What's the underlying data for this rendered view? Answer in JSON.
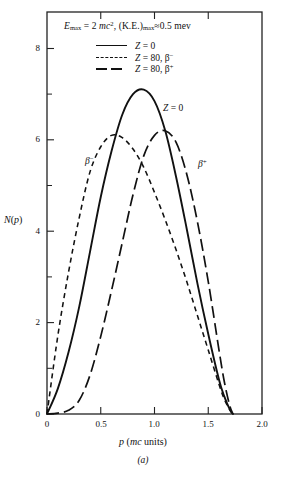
{
  "figure": {
    "caption": "(a)",
    "title_plain": "E_max = 2 mc^2, (K.E.)_max ≈ 0.5 mev",
    "title": {
      "e": "E",
      "e_sub": "max",
      "eq": " = 2 ",
      "mc": "mc",
      "mc_sup": "2",
      "comma": ", (K.E.)",
      "ke_sub": "max",
      "approx": "≈0.5 mev"
    }
  },
  "legend": {
    "position": "top-center-inside",
    "items": [
      {
        "style": "solid",
        "label_plain": "Z = 0",
        "z": "Z",
        "rest": " = 0",
        "sup": ""
      },
      {
        "style": "short-dash",
        "label_plain": "Z = 80, β−",
        "z": "Z",
        "rest": " = 80, β",
        "sup": "−"
      },
      {
        "style": "long-dash",
        "label_plain": "Z = 80, β+",
        "z": "Z",
        "rest": " = 80, β",
        "sup": "+"
      }
    ]
  },
  "axes": {
    "ylabel_n": "N",
    "ylabel_p": "p",
    "ylabel_plain": "N(p)",
    "xlabel_p": "p",
    "xlabel_rest_a": " (",
    "xlabel_mc": "mc",
    "xlabel_rest_b": " units)",
    "xlabel_plain": "p (mc units)",
    "ylim": [
      0,
      8.8
    ],
    "xlim": [
      0,
      2.0
    ],
    "yticks_major": [
      0,
      2,
      4,
      6,
      8
    ],
    "yticks_major_labels": [
      "0",
      "2",
      "4",
      "6",
      "8"
    ],
    "yticks_minor": [
      1,
      3,
      5,
      7
    ],
    "xticks_major": [
      0,
      0.5,
      1.0,
      1.5,
      2.0
    ],
    "xticks_major_labels": [
      "0",
      "0.5",
      "1.0",
      "1.5",
      "2.0"
    ],
    "grid": false,
    "frame": "box"
  },
  "annotations": [
    {
      "id": "z0",
      "text_plain": "Z = 0",
      "z": "Z",
      "rest": " = 0",
      "sup": ""
    },
    {
      "id": "beta-minus",
      "text_plain": "β−",
      "z": "β",
      "rest": "",
      "sup": "−"
    },
    {
      "id": "beta-plus",
      "text_plain": "β+",
      "z": "β",
      "rest": "",
      "sup": "+"
    }
  ],
  "chart_data": {
    "type": "line",
    "xlabel": "p (mc units)",
    "ylabel": "N(p)",
    "xlim": [
      0,
      2.0
    ],
    "ylim": [
      0,
      8.8
    ],
    "grid": false,
    "legend_position": "top-center-inside",
    "x": [
      0.0,
      0.1,
      0.2,
      0.3,
      0.4,
      0.5,
      0.6,
      0.7,
      0.8,
      0.9,
      1.0,
      1.1,
      1.2,
      1.3,
      1.4,
      1.5,
      1.6,
      1.65,
      1.7,
      1.73
    ],
    "series": [
      {
        "name": "Z = 0",
        "style": "solid",
        "peak_x": 0.9,
        "peak_y": 7.1,
        "endpoint_x": 1.73,
        "values": [
          0.0,
          0.55,
          1.35,
          2.35,
          3.55,
          4.75,
          5.75,
          6.55,
          7.0,
          7.1,
          6.85,
          6.2,
          5.2,
          4.05,
          2.85,
          1.75,
          0.75,
          0.38,
          0.1,
          0.0
        ]
      },
      {
        "name": "Z = 80, β−",
        "style": "short-dash",
        "peak_x": 0.62,
        "peak_y": 6.1,
        "endpoint_x": 1.73,
        "values": [
          0.0,
          1.7,
          3.1,
          4.3,
          5.3,
          5.85,
          6.1,
          6.05,
          5.8,
          5.4,
          4.85,
          4.25,
          3.6,
          2.9,
          2.15,
          1.4,
          0.65,
          0.32,
          0.09,
          0.0
        ]
      },
      {
        "name": "Z = 80, β+",
        "style": "long-dash",
        "peak_x": 1.1,
        "peak_y": 6.2,
        "endpoint_x": 1.73,
        "values": [
          0.0,
          0.02,
          0.08,
          0.3,
          0.85,
          1.7,
          2.7,
          3.75,
          4.8,
          5.65,
          6.1,
          6.2,
          5.95,
          5.25,
          4.2,
          2.9,
          1.4,
          0.7,
          0.18,
          0.0
        ]
      }
    ]
  }
}
